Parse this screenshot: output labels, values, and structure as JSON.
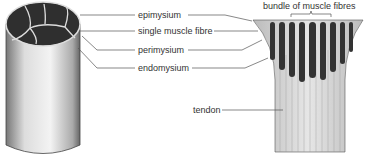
{
  "diagram": {
    "labels": {
      "epimysium": "epimysium",
      "single_fibre": "single muscle fibre",
      "perimysium": "perimysium",
      "endomysium": "endomysium",
      "bundle": "bundle of muscle fibres",
      "tendon": "tendon"
    },
    "colors": {
      "line": "#555555",
      "bundle_fill": "#3a3a3a",
      "cylinder_fill": "#e8e8e8"
    }
  }
}
